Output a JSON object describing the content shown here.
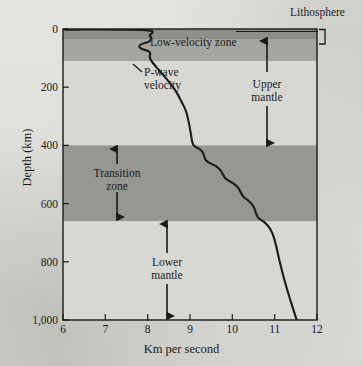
{
  "chart_data": {
    "type": "line",
    "title": "",
    "xlabel": "Km per second",
    "ylabel": "Depth (km)",
    "xlim": [
      6,
      12
    ],
    "ylim": [
      0,
      1000
    ],
    "y_inverted": true,
    "grid": false,
    "legend_position": "none",
    "xticks": [
      "6",
      "7",
      "8",
      "9",
      "10",
      "11",
      "12"
    ],
    "xtick_values": [
      6,
      7,
      8,
      9,
      10,
      11,
      12
    ],
    "yticks": [
      "0",
      "200",
      "400",
      "600",
      "800",
      "1,000"
    ],
    "ytick_values": [
      0,
      200,
      400,
      600,
      800,
      1000
    ],
    "series": [
      {
        "name": "P-wave velocity",
        "x": [
          6.05,
          7.95,
          8.05,
          8.08,
          8.02,
          7.86,
          7.8,
          7.86,
          8.02,
          8.06,
          8.05,
          8.1,
          8.2,
          8.32,
          8.45,
          8.58,
          8.7,
          8.8,
          8.9,
          8.97,
          9.02,
          9.06,
          9.12,
          9.22,
          9.3,
          9.34,
          9.38,
          9.48,
          9.62,
          9.72,
          9.78,
          9.83,
          9.92,
          10.04,
          10.14,
          10.2,
          10.26,
          10.36,
          10.45,
          10.52,
          10.56,
          10.62,
          10.74,
          10.84,
          10.92,
          10.98,
          11.04,
          11.12,
          11.24,
          11.38,
          11.52
        ],
        "y": [
          2,
          4,
          22,
          34,
          44,
          52,
          60,
          68,
          76,
          84,
          96,
          112,
          130,
          150,
          172,
          196,
          222,
          250,
          280,
          320,
          360,
          392,
          404,
          412,
          424,
          440,
          452,
          462,
          472,
          486,
          500,
          512,
          522,
          532,
          546,
          562,
          576,
          588,
          600,
          616,
          634,
          650,
          662,
          676,
          694,
          716,
          748,
          800,
          868,
          936,
          1000
        ]
      }
    ],
    "bands": [
      {
        "name": "lithosphere",
        "label": "Lithosphere",
        "depth_top": 0,
        "depth_bottom": 35,
        "color": "#8e8e8a"
      },
      {
        "name": "low-velocity-zone",
        "label": "Low-velocity zone",
        "depth_top": 35,
        "depth_bottom": 210,
        "color": "#a5a5a0"
      },
      {
        "name": "upper-mantle-rest",
        "label": "",
        "depth_top": 210,
        "depth_bottom": 400,
        "color": "#d8d8d3"
      },
      {
        "name": "transition-zone",
        "label": "Transition zone",
        "depth_top": 400,
        "depth_bottom": 660,
        "color": "#979792"
      },
      {
        "name": "lower-mantle",
        "label": "Lower mantle",
        "depth_top": 660,
        "depth_bottom": 1000,
        "color": "#d8d8d3"
      }
    ],
    "annotations": [
      {
        "name": "lithosphere",
        "text": "Lithosphere",
        "marker": "bracket"
      },
      {
        "name": "low-velocity-zone",
        "text": "Low-velocity zone",
        "marker": "none"
      },
      {
        "name": "p-wave-velocity",
        "text": "P-wave\nvelocity",
        "marker": "leader-line"
      },
      {
        "name": "upper-mantle",
        "text": "Upper\nmantle",
        "marker": "double-arrow",
        "depth_from": 35,
        "depth_to": 400
      },
      {
        "name": "transition-zone",
        "text": "Transition\nzone",
        "marker": "double-arrow",
        "depth_from": 400,
        "depth_to": 660
      },
      {
        "name": "lower-mantle",
        "text": "Lower\nmantle",
        "marker": "double-arrow",
        "depth_from": 660,
        "depth_to": 1000
      }
    ],
    "colors": {
      "curve": "#1a1a1a",
      "axis": "#1a1a1a",
      "plot_background": "#d8d8d3",
      "page_background": "#cdcdc8"
    }
  },
  "labels": {
    "y_axis_title": "Depth (km)",
    "x_axis_title": "Km per second",
    "lithosphere": "Lithosphere",
    "low_velocity_zone": "Low-velocity zone",
    "p_wave_line1": "P-wave",
    "p_wave_line2": "velocity",
    "upper_mantle_line1": "Upper",
    "upper_mantle_line2": "mantle",
    "transition_line1": "Transition",
    "transition_line2": "zone",
    "lower_mantle_line1": "Lower",
    "lower_mantle_line2": "mantle"
  }
}
